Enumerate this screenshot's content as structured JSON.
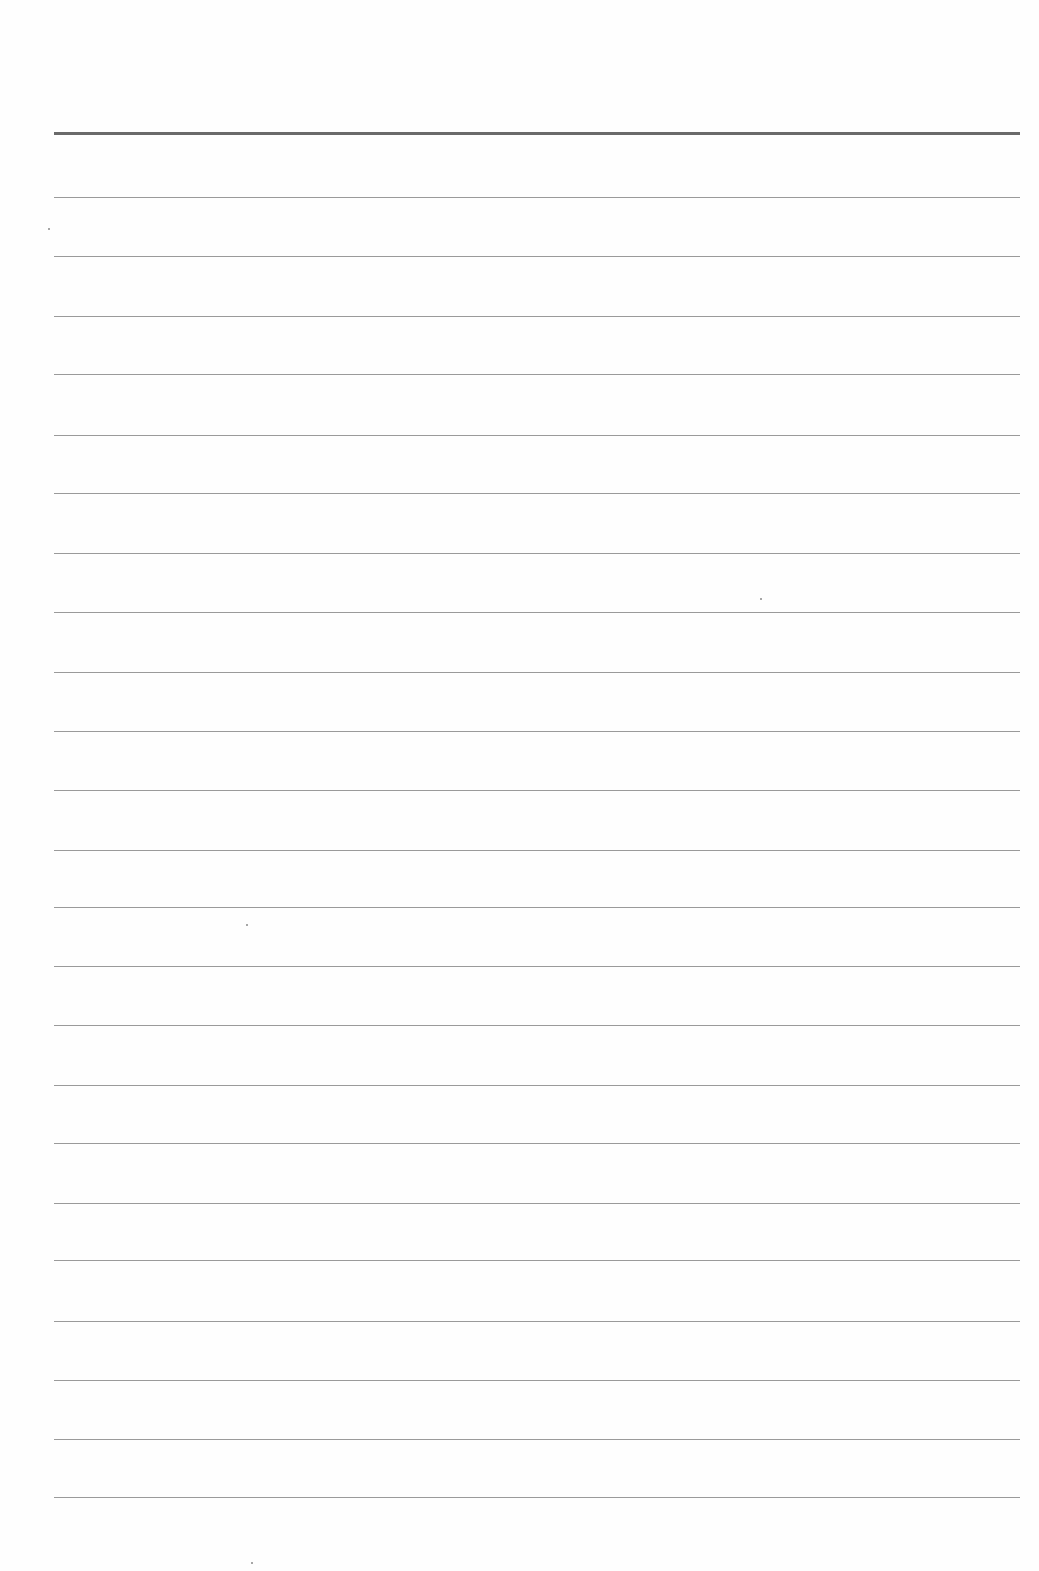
{
  "page": {
    "type": "lined-paper",
    "content_text": "",
    "colors": {
      "paper": "#fefefe",
      "header_rule": "#6a6a6a",
      "rule": "#9a9a9a"
    },
    "header_rule_y": 133,
    "rules_y": [
      197,
      256,
      316,
      374,
      435,
      493,
      553,
      612,
      672,
      731,
      790,
      850,
      907,
      966,
      1025,
      1085,
      1143,
      1203,
      1260,
      1321,
      1380,
      1439,
      1497
    ],
    "rule_left": 54,
    "rule_right": 1020
  }
}
